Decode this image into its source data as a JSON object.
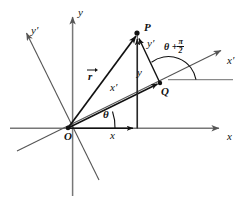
{
  "figure": {
    "labels": {
      "y_axis": "y",
      "x_axis": "x",
      "y_prime_axis": "y′",
      "x_prime_axis": "x′",
      "origin": "O",
      "point_p": "P",
      "point_q": "Q",
      "vector_r": "r",
      "component_x": "x",
      "component_y": "y",
      "component_x_prime": "x′",
      "component_y_prime": "y′",
      "angle_theta": "θ",
      "angle_theta_plus": "θ +",
      "pi_numerator": "π",
      "pi_denominator": "2"
    },
    "colors": {
      "ink": "#111111",
      "axis_gray": "#6e6e6e",
      "background": "#ffffff"
    },
    "geometry": {
      "origin": [
        68,
        128
      ],
      "point_p": [
        137,
        33
      ],
      "point_q": [
        160,
        83
      ],
      "x_axis_arrow_tip": [
        224,
        128
      ],
      "y_axis_arrow_tip": [
        73,
        12
      ],
      "x_prime_arrow_tip": [
        226,
        47
      ],
      "y_prime_arrow_tip": [
        22,
        29
      ],
      "theta_degrees": 19,
      "theta_plus_half_pi_degrees": 109
    }
  }
}
